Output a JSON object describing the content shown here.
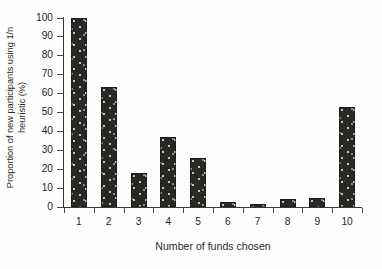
{
  "chart_data": {
    "type": "bar",
    "title": "",
    "xlabel": "Number of funds chosen",
    "ylabel": "Proportion of new participants using 1/n heuristic (%)",
    "ylabel_line1": "Proportion of new participants using 1/n",
    "ylabel_line2": "heuristic (%)",
    "categories": [
      "1",
      "2",
      "3",
      "4",
      "5",
      "6",
      "7",
      "8",
      "9",
      "10"
    ],
    "values": [
      100,
      63.5,
      18,
      37,
      26,
      2.5,
      1.5,
      4,
      5,
      53
    ],
    "ylim": [
      0,
      100
    ],
    "ytick_labels": [
      "0",
      "10",
      "20",
      "30",
      "40",
      "50",
      "60",
      "70",
      "80",
      "90",
      "100"
    ],
    "ytick_values": [
      0,
      10,
      20,
      30,
      40,
      50,
      60,
      70,
      80,
      90,
      100
    ],
    "grid": false,
    "legend": null,
    "bar_color": "#2a2824",
    "bar_pattern": "light-speckle-dots",
    "axis_color": "#3a3a3a",
    "background_color": "#fefefe"
  }
}
